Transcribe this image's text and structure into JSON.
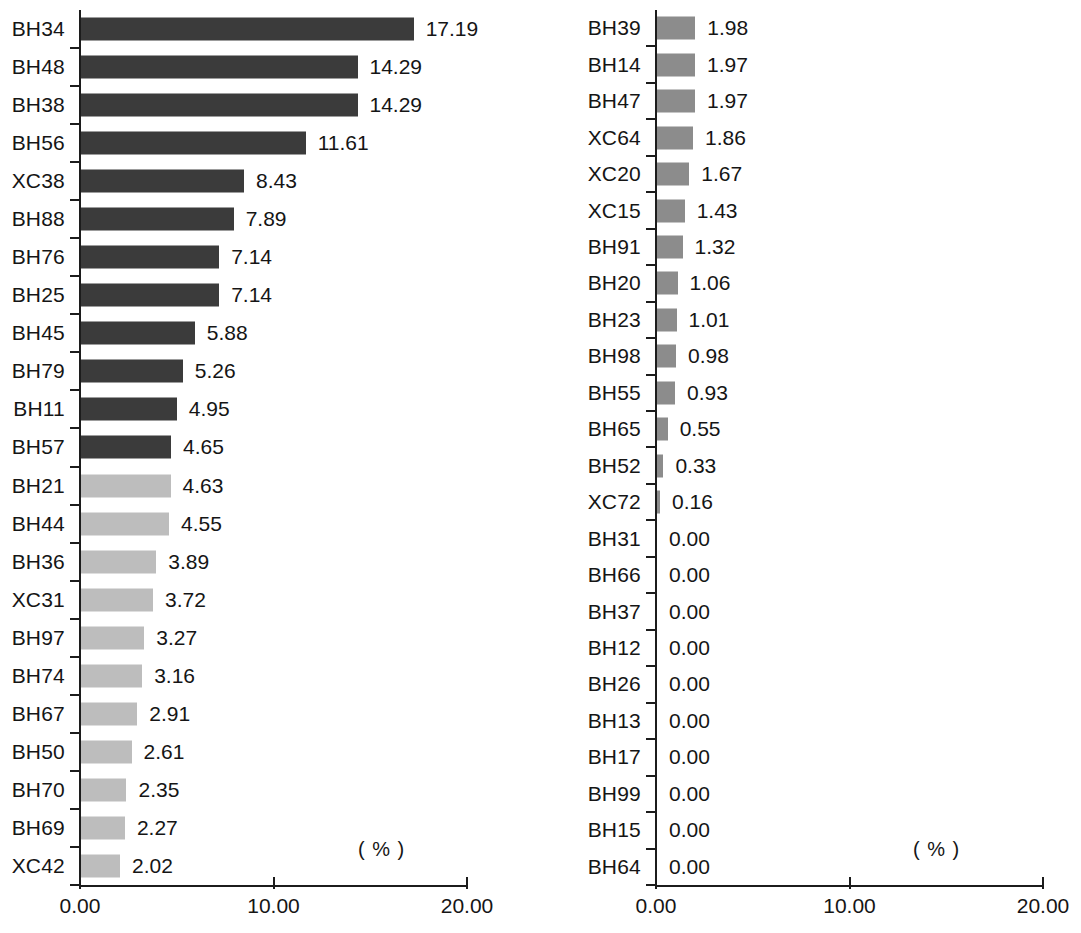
{
  "chart_data": [
    {
      "type": "bar",
      "orientation": "horizontal",
      "panel": "left",
      "title": "",
      "xlabel": "( % )",
      "ylabel": "",
      "xlim": [
        0,
        20
      ],
      "xticks": [
        0,
        10,
        20
      ],
      "xtick_labels": [
        "0.00",
        "10.00",
        "20.00"
      ],
      "unit_annotation": "( % )",
      "grid": false,
      "legend": false,
      "value_label_format": "2 decimals",
      "categories": [
        "BH34",
        "BH48",
        "BH38",
        "BH56",
        "XC38",
        "BH88",
        "BH76",
        "BH25",
        "BH45",
        "BH79",
        "BH11",
        "BH57",
        "BH21",
        "BH44",
        "BH36",
        "XC31",
        "BH97",
        "BH74",
        "BH67",
        "BH50",
        "BH70",
        "BH69",
        "XC42"
      ],
      "values": [
        17.19,
        14.29,
        14.29,
        11.61,
        8.43,
        7.89,
        7.14,
        7.14,
        5.88,
        5.26,
        4.95,
        4.65,
        4.63,
        4.55,
        3.89,
        3.72,
        3.27,
        3.16,
        2.91,
        2.61,
        2.35,
        2.27,
        2.02
      ],
      "value_labels": [
        "17.19",
        "14.29",
        "14.29",
        "11.61",
        "8.43",
        "7.89",
        "7.14",
        "7.14",
        "5.88",
        "5.26",
        "4.95",
        "4.65",
        "4.63",
        "4.55",
        "3.89",
        "3.72",
        "3.27",
        "3.16",
        "2.91",
        "2.61",
        "2.35",
        "2.27",
        "2.02"
      ],
      "bar_shades": [
        "dark",
        "dark",
        "dark",
        "dark",
        "dark",
        "dark",
        "dark",
        "dark",
        "dark",
        "dark",
        "dark",
        "dark",
        "light",
        "light",
        "light",
        "light",
        "light",
        "light",
        "light",
        "light",
        "light",
        "light",
        "light"
      ],
      "colors": {
        "dark": "#3b3b3b",
        "light": "#bdbdbd",
        "axis": "#1c1c1c",
        "text": "#151515",
        "background": "#ffffff"
      }
    },
    {
      "type": "bar",
      "orientation": "horizontal",
      "panel": "right",
      "title": "",
      "xlabel": "( % )",
      "ylabel": "",
      "xlim": [
        0,
        20
      ],
      "xticks": [
        0,
        10,
        20
      ],
      "xtick_labels": [
        "0.00",
        "10.00",
        "20.00"
      ],
      "unit_annotation": "( % )",
      "grid": false,
      "legend": false,
      "value_label_format": "2 decimals",
      "categories": [
        "BH39",
        "BH14",
        "BH47",
        "XC64",
        "XC20",
        "XC15",
        "BH91",
        "BH20",
        "BH23",
        "BH98",
        "BH55",
        "BH65",
        "BH52",
        "XC72",
        "BH31",
        "BH66",
        "BH37",
        "BH12",
        "BH26",
        "BH13",
        "BH17",
        "BH99",
        "BH15",
        "BH64"
      ],
      "values": [
        1.98,
        1.97,
        1.97,
        1.86,
        1.67,
        1.43,
        1.32,
        1.06,
        1.01,
        0.98,
        0.93,
        0.55,
        0.33,
        0.16,
        0.0,
        0.0,
        0.0,
        0.0,
        0.0,
        0.0,
        0.0,
        0.0,
        0.0,
        0.0
      ],
      "value_labels": [
        "1.98",
        "1.97",
        "1.97",
        "1.86",
        "1.67",
        "1.43",
        "1.32",
        "1.06",
        "1.01",
        "0.98",
        "0.93",
        "0.55",
        "0.33",
        "0.16",
        "0.00",
        "0.00",
        "0.00",
        "0.00",
        "0.00",
        "0.00",
        "0.00",
        "0.00",
        "0.00",
        "0.00"
      ],
      "bar_shades": [
        "mid",
        "mid",
        "mid",
        "mid",
        "mid",
        "mid",
        "mid",
        "mid",
        "mid",
        "mid",
        "mid",
        "mid",
        "mid",
        "mid",
        "mid",
        "mid",
        "mid",
        "mid",
        "mid",
        "mid",
        "mid",
        "mid",
        "mid",
        "mid"
      ],
      "colors": {
        "mid": "#8c8c8c",
        "axis": "#1c1c1c",
        "text": "#151515",
        "background": "#ffffff"
      }
    }
  ]
}
